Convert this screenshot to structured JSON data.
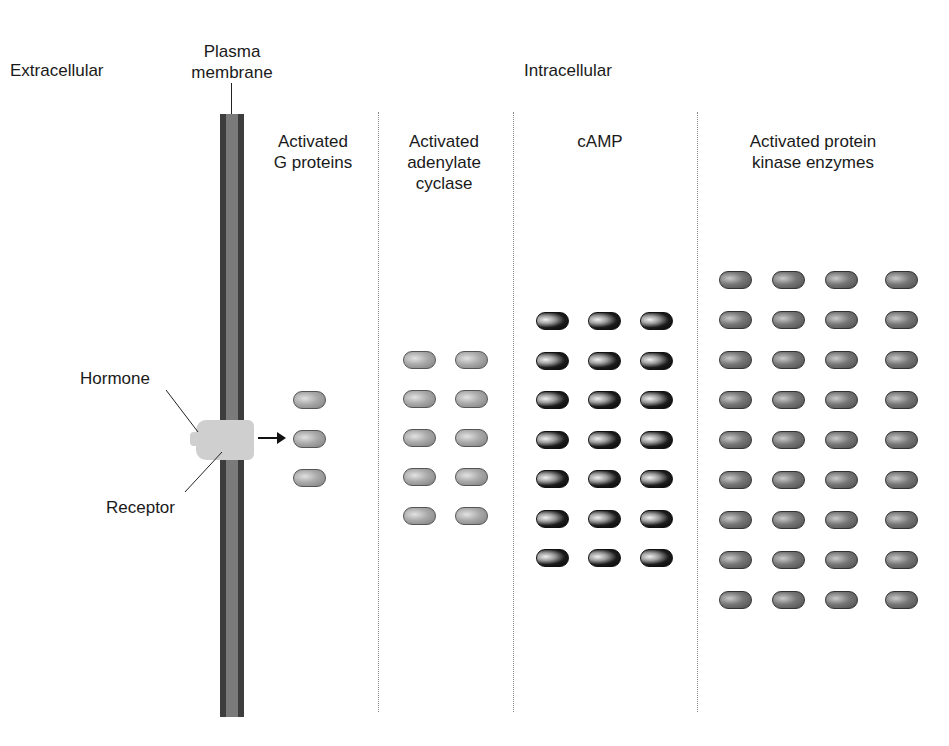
{
  "labels": {
    "extracellular": "Extracellular",
    "plasma_membrane": "Plasma\nmembrane",
    "intracellular": "Intracellular",
    "g_proteins": "Activated\nG proteins",
    "adenylate_cyclase": "Activated\nadenylate\ncyclase",
    "camp": "cAMP",
    "protein_kinase": "Activated protein\nkinase enzymes",
    "hormone": "Hormone",
    "receptor": "Receptor"
  },
  "columns": [
    {
      "id": "g_proteins",
      "rows": 3,
      "cols": 1,
      "count": 3
    },
    {
      "id": "adenylate_cyclase",
      "rows": 5,
      "cols": 2,
      "count": 10
    },
    {
      "id": "camp",
      "rows": 7,
      "cols": 3,
      "count": 21
    },
    {
      "id": "protein_kinase",
      "rows": 9,
      "cols": 4,
      "count": 36
    }
  ],
  "colors": {
    "membrane_outer": "#3d3d3d",
    "membrane_inner": "#7a7a7a",
    "receptor": "#cfcfcf",
    "divider": "#8a8a8a"
  }
}
